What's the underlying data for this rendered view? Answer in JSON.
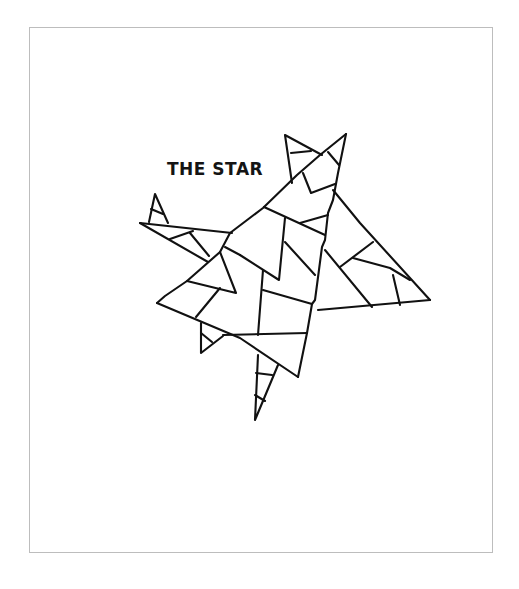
{
  "page": {
    "title": "THE STAR",
    "illustration": {
      "subject": "star made of overlapping triangles",
      "icon": "star-drawing",
      "line_color": "#111111",
      "frame_color": "#bdbdbd",
      "background_color": "#ffffff"
    }
  }
}
